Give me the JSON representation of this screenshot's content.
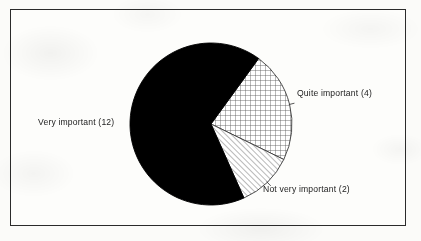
{
  "figure": {
    "frame_color": "#2b2b2b",
    "background_color": "#fdfdfb"
  },
  "chart_data": {
    "type": "pie",
    "title": "",
    "subtitle": "",
    "xlabel": "",
    "ylabel": "",
    "grid": false,
    "legend_position": "none",
    "labels_position": "outside-callout",
    "total": 18,
    "units": "responses",
    "start_angle_deg_from_12oclock": 36,
    "direction": "clockwise",
    "center": {
      "x": 211,
      "y": 124
    },
    "radius": 81,
    "categories": [
      "Quite important",
      "Not very important",
      "Very important"
    ],
    "values": [
      4,
      2,
      12
    ],
    "slices": [
      {
        "label": "Quite important (4)",
        "name": "Quite important",
        "value": 4,
        "percent": 22.2,
        "angle_deg": 80,
        "start_deg": 36,
        "end_deg": 116,
        "fill": "crosshatch",
        "fill_color": "#ffffff",
        "line_color": "#555555"
      },
      {
        "label": "Not very important (2)",
        "name": "Not very important",
        "value": 2,
        "percent": 11.1,
        "angle_deg": 40,
        "start_deg": 116,
        "end_deg": 156,
        "fill": "diagonal-hatch",
        "fill_color": "#ffffff",
        "line_color": "#555555"
      },
      {
        "label": "Very important (12)",
        "name": "Very important",
        "value": 12,
        "percent": 66.7,
        "angle_deg": 240,
        "start_deg": 156,
        "end_deg": 396,
        "fill": "solid",
        "fill_color": "#000000",
        "line_color": "#000000"
      }
    ]
  }
}
